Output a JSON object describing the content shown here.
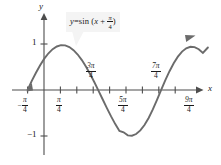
{
  "figure": {
    "background_color": "#ffffff",
    "curve_color": "#6b6b6b",
    "axis_color": "#4d4d4d",
    "text_color": "#1a1a1a",
    "callout_background": "#f4f4f4"
  },
  "equation": {
    "lhs": "y",
    "equals": "=",
    "func": "sin",
    "open_paren": "(",
    "arg_x": "x",
    "plus": "+",
    "arg_frac_num": "π",
    "arg_frac_den": "4",
    "close_paren": ")"
  },
  "axes": {
    "x_label": "x",
    "y_label": "y"
  },
  "y_ticks": [
    {
      "label": "1",
      "value": 1
    },
    {
      "label": "−1",
      "value": -1
    }
  ],
  "x_ticks": [
    {
      "sign": "−",
      "num": "π",
      "den": "4",
      "label": "-pi/4",
      "value": -0.7853981634,
      "position": "below"
    },
    {
      "sign": "",
      "num": "π",
      "den": "4",
      "label": "pi/4",
      "value": 0.7853981634,
      "position": "below"
    },
    {
      "sign": "",
      "num": "3π",
      "den": "4",
      "label": "3pi/4",
      "value": 2.3561944902,
      "position": "above"
    },
    {
      "sign": "",
      "num": "5π",
      "den": "4",
      "label": "5pi/4",
      "value": 3.926990817,
      "position": "below"
    },
    {
      "sign": "",
      "num": "7π",
      "den": "4",
      "label": "7pi/4",
      "value": 5.4977871438,
      "position": "above"
    },
    {
      "sign": "",
      "num": "9π",
      "den": "4",
      "label": "9pi/4",
      "value": 7.0685834706,
      "position": "below"
    }
  ],
  "chart_data": {
    "type": "line",
    "xlabel": "x",
    "ylabel": "y",
    "grid": false,
    "legend": "none",
    "xlim": [
      -1.1781,
      8.2467
    ],
    "ylim": [
      -1.45,
      1.45
    ],
    "function": "y = sin(x + pi/4)",
    "x_tick_labels": [
      "-π/4",
      "π/4",
      "3π/4",
      "5π/4",
      "7π/4",
      "9π/4"
    ],
    "x_tick_values": [
      -0.7854,
      0.7854,
      2.3562,
      3.927,
      5.4978,
      7.0686
    ],
    "x_minor_tick_values": [
      0.0,
      1.5708,
      3.1416,
      4.7124,
      6.2832,
      7.854
    ],
    "y_tick_labels": [
      "1",
      "−1"
    ],
    "y_tick_values": [
      1,
      -1
    ],
    "key_points": [
      {
        "name": "start",
        "x": -0.7854,
        "y": 0
      },
      {
        "name": "maximum",
        "x": 0.7854,
        "y": 1
      },
      {
        "name": "descending-zero",
        "x": 2.3562,
        "y": 0
      },
      {
        "name": "minimum",
        "x": 3.927,
        "y": -1
      },
      {
        "name": "ascending-zero",
        "x": 5.4978,
        "y": 0
      },
      {
        "name": "end",
        "x": 7.854,
        "y": 0.924
      }
    ],
    "series": [
      {
        "name": "y = sin (x + π/4)",
        "x": [
          -0.7854,
          -0.5854,
          -0.3854,
          -0.1854,
          0.0146,
          0.2146,
          0.4146,
          0.6146,
          0.8146,
          1.0146,
          1.2146,
          1.4146,
          1.6146,
          1.8146,
          2.0146,
          2.2146,
          2.4146,
          2.6146,
          2.8146,
          3.0146,
          3.2146,
          3.4146,
          3.6146,
          3.8146,
          4.0146,
          4.2146,
          4.4146,
          4.6146,
          4.8146,
          5.0146,
          5.2146,
          5.4146,
          5.6146,
          5.8146,
          6.0146,
          6.2146,
          6.4146,
          6.6146,
          6.8146,
          7.0146,
          7.2146,
          7.4146,
          7.6146,
          7.854
        ],
        "y": [
          0.0,
          0.1987,
          0.3758,
          0.5396,
          0.6816,
          0.7985,
          0.8874,
          0.9463,
          0.9738,
          0.9693,
          0.9332,
          0.8665,
          0.7712,
          0.65,
          0.5063,
          0.3441,
          0.1679,
          -0.0175,
          -0.2066,
          -0.3939,
          -0.574,
          -0.7415,
          -0.8915,
          -0.9193,
          -0.9866,
          -0.9938,
          -0.9573,
          -0.8789,
          -0.7612,
          -0.6077,
          -0.4231,
          -0.2128,
          0.0029,
          0.2128,
          0.4086,
          0.5818,
          0.7256,
          0.8352,
          0.9073,
          0.9402,
          0.9333,
          0.8877,
          0.8056,
          0.9239
        ]
      }
    ]
  }
}
